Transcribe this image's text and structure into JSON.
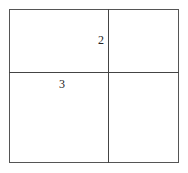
{
  "diagram": {
    "type": "2x2 grid",
    "cells": [
      {
        "position": "top-left",
        "label": "2",
        "label_anchor": "bottom-right"
      },
      {
        "position": "top-right",
        "label": ""
      },
      {
        "position": "bottom-left",
        "label": "3",
        "label_anchor": "top-center"
      },
      {
        "position": "bottom-right",
        "label": ""
      }
    ],
    "labels": [
      "2",
      "3"
    ],
    "line_color": "#444444"
  }
}
